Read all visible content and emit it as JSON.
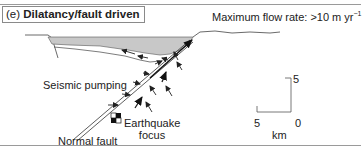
{
  "panel": {
    "letter": "(e)",
    "title": "Dilatancy/fault driven"
  },
  "flow_rate": {
    "label": "Maximum flow rate: >10 m yr",
    "exponent": "−1"
  },
  "labels": {
    "seismic_pumping": "Seismic pumping",
    "earthquake_focus_line1": "Earthquake",
    "earthquake_focus_line2": "focus",
    "normal_fault": "Normal fault"
  },
  "scale_bar": {
    "vertical_top": "5",
    "horizontal_left": "5",
    "origin": "0",
    "unit": "km"
  },
  "colors": {
    "basin_fill": "#c8c8c8",
    "line": "#333333",
    "frame": "#9a9a9a"
  }
}
